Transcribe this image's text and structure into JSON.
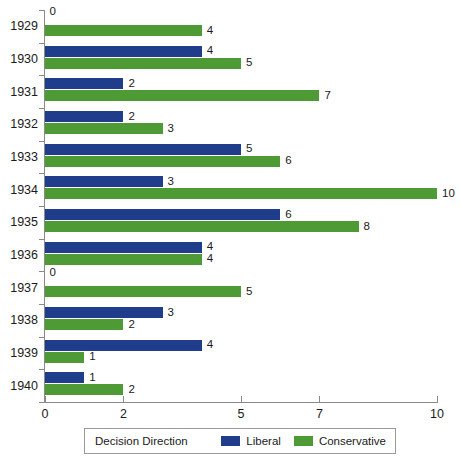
{
  "chart_data": {
    "type": "bar",
    "orientation": "horizontal",
    "title": "",
    "xlabel": "",
    "ylabel": "",
    "xlim": [
      0,
      10
    ],
    "ylim": null,
    "grid": false,
    "legend_position": "bottom",
    "legend_title": "Decision Direction",
    "x_ticks": [
      0,
      2,
      5,
      7,
      10
    ],
    "x_tick_labels": [
      "0",
      "2",
      "5",
      "7",
      "10"
    ],
    "categories": [
      "1929",
      "1930",
      "1931",
      "1932",
      "1933",
      "1934",
      "1935",
      "1936",
      "1937",
      "1938",
      "1939",
      "1940"
    ],
    "series": [
      {
        "name": "Liberal",
        "color": "#1f3d8a",
        "values": [
          0,
          4,
          2,
          2,
          5,
          3,
          6,
          4,
          0,
          3,
          4,
          1
        ],
        "value_labels": [
          "0",
          "4",
          "2",
          "2",
          "5",
          "3",
          "6",
          "4",
          "0",
          "3",
          "4",
          "1"
        ]
      },
      {
        "name": "Conservative",
        "color": "#4e9b36",
        "values": [
          4,
          5,
          7,
          3,
          6,
          10,
          8,
          4,
          5,
          2,
          1,
          2
        ],
        "value_labels": [
          "4",
          "5",
          "7",
          "3",
          "6",
          "10",
          "8",
          "4",
          "5",
          "2",
          "1",
          "2"
        ]
      }
    ]
  },
  "legend": {
    "title": "Decision Direction",
    "entries": [
      {
        "label": "Liberal",
        "color": "#1f3d8a"
      },
      {
        "label": "Conservative",
        "color": "#4e9b36"
      }
    ]
  },
  "colors": {
    "liberal": "#1f3d8a",
    "conservative": "#4e9b36",
    "axis": "#8a8a8a",
    "text": "#1a1a1a",
    "background": "#ffffff"
  }
}
